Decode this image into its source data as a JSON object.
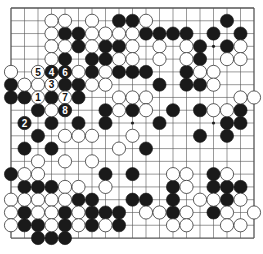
{
  "board": {
    "size": 19,
    "origin_x": 11,
    "origin_y": 8,
    "spacing_x": 13.5,
    "spacing_y": 12.78,
    "stone_radius": 6.6,
    "line_color": "#555555",
    "black_color": "#1a1a1a",
    "white_color": "#ffffff",
    "star_points": [
      [
        3,
        3
      ],
      [
        3,
        9
      ],
      [
        3,
        15
      ],
      [
        9,
        3
      ],
      [
        9,
        9
      ],
      [
        9,
        15
      ],
      [
        15,
        3
      ],
      [
        15,
        9
      ],
      [
        15,
        15
      ]
    ]
  },
  "stones": {
    "black": [
      [
        8,
        1
      ],
      [
        9,
        1
      ],
      [
        16,
        1
      ],
      [
        4,
        2
      ],
      [
        5,
        2
      ],
      [
        10,
        2
      ],
      [
        11,
        2
      ],
      [
        12,
        2
      ],
      [
        13,
        2
      ],
      [
        15,
        2
      ],
      [
        17,
        2
      ],
      [
        5,
        3
      ],
      [
        7,
        3
      ],
      [
        8,
        3
      ],
      [
        14,
        3
      ],
      [
        16,
        3
      ],
      [
        4,
        4
      ],
      [
        6,
        4
      ],
      [
        7,
        4
      ],
      [
        14,
        4
      ],
      [
        6,
        5
      ],
      [
        8,
        5
      ],
      [
        9,
        5
      ],
      [
        10,
        5
      ],
      [
        13,
        5
      ],
      [
        0,
        6
      ],
      [
        4,
        6
      ],
      [
        5,
        6
      ],
      [
        11,
        6
      ],
      [
        13,
        6
      ],
      [
        14,
        6
      ],
      [
        0,
        7
      ],
      [
        1,
        7
      ],
      [
        3,
        7
      ],
      [
        5,
        7
      ],
      [
        2,
        8
      ],
      [
        7,
        8
      ],
      [
        9,
        8
      ],
      [
        12,
        8
      ],
      [
        14,
        8
      ],
      [
        17,
        8
      ],
      [
        3,
        9
      ],
      [
        5,
        9
      ],
      [
        7,
        9
      ],
      [
        11,
        9
      ],
      [
        16,
        9
      ],
      [
        17,
        9
      ],
      [
        2,
        10
      ],
      [
        14,
        10
      ],
      [
        16,
        10
      ],
      [
        1,
        11
      ],
      [
        3,
        11
      ],
      [
        10,
        11
      ],
      [
        0,
        13
      ],
      [
        7,
        13
      ],
      [
        9,
        13
      ],
      [
        15,
        13
      ],
      [
        1,
        14
      ],
      [
        2,
        14
      ],
      [
        3,
        14
      ],
      [
        12,
        14
      ],
      [
        15,
        14
      ],
      [
        16,
        14
      ],
      [
        17,
        14
      ],
      [
        5,
        15
      ],
      [
        6,
        15
      ],
      [
        9,
        15
      ],
      [
        10,
        15
      ],
      [
        12,
        15
      ],
      [
        16,
        15
      ],
      [
        1,
        16
      ],
      [
        4,
        16
      ],
      [
        6,
        16
      ],
      [
        7,
        16
      ],
      [
        8,
        16
      ],
      [
        12,
        16
      ],
      [
        15,
        16
      ],
      [
        1,
        17
      ],
      [
        2,
        17
      ],
      [
        4,
        17
      ],
      [
        6,
        17
      ],
      [
        8,
        17
      ],
      [
        2,
        18
      ],
      [
        3,
        18
      ],
      [
        4,
        18
      ]
    ],
    "white": [
      [
        3,
        1
      ],
      [
        4,
        1
      ],
      [
        6,
        1
      ],
      [
        10,
        1
      ],
      [
        3,
        2
      ],
      [
        6,
        2
      ],
      [
        7,
        2
      ],
      [
        8,
        2
      ],
      [
        9,
        2
      ],
      [
        3,
        3
      ],
      [
        4,
        3
      ],
      [
        6,
        3
      ],
      [
        9,
        3
      ],
      [
        11,
        3
      ],
      [
        13,
        3
      ],
      [
        17,
        3
      ],
      [
        3,
        4
      ],
      [
        8,
        4
      ],
      [
        9,
        4
      ],
      [
        11,
        4
      ],
      [
        13,
        4
      ],
      [
        16,
        4
      ],
      [
        17,
        4
      ],
      [
        0,
        5
      ],
      [
        5,
        5
      ],
      [
        7,
        5
      ],
      [
        14,
        5
      ],
      [
        15,
        5
      ],
      [
        1,
        6
      ],
      [
        2,
        6
      ],
      [
        6,
        6
      ],
      [
        7,
        6
      ],
      [
        15,
        6
      ],
      [
        8,
        7
      ],
      [
        9,
        7
      ],
      [
        10,
        7
      ],
      [
        17,
        7
      ],
      [
        18,
        7
      ],
      [
        3,
        8
      ],
      [
        8,
        8
      ],
      [
        10,
        8
      ],
      [
        15,
        8
      ],
      [
        16,
        8
      ],
      [
        4,
        10
      ],
      [
        5,
        10
      ],
      [
        6,
        10
      ],
      [
        9,
        10
      ],
      [
        8,
        11
      ],
      [
        2,
        12
      ],
      [
        4,
        12
      ],
      [
        6,
        12
      ],
      [
        1,
        13
      ],
      [
        2,
        13
      ],
      [
        12,
        13
      ],
      [
        13,
        13
      ],
      [
        16,
        13
      ],
      [
        4,
        14
      ],
      [
        5,
        14
      ],
      [
        7,
        14
      ],
      [
        13,
        14
      ],
      [
        0,
        15
      ],
      [
        1,
        15
      ],
      [
        2,
        15
      ],
      [
        3,
        15
      ],
      [
        4,
        15
      ],
      [
        14,
        15
      ],
      [
        15,
        15
      ],
      [
        17,
        15
      ],
      [
        0,
        16
      ],
      [
        2,
        16
      ],
      [
        3,
        16
      ],
      [
        5,
        16
      ],
      [
        10,
        16
      ],
      [
        11,
        16
      ],
      [
        13,
        16
      ],
      [
        16,
        16
      ],
      [
        18,
        16
      ],
      [
        0,
        17
      ],
      [
        3,
        17
      ],
      [
        5,
        17
      ],
      [
        7,
        17
      ],
      [
        12,
        17
      ],
      [
        13,
        17
      ],
      [
        16,
        17
      ],
      [
        17,
        17
      ]
    ]
  },
  "moves": [
    {
      "number": "1",
      "color": "white",
      "x": 2,
      "y": 7
    },
    {
      "number": "2",
      "color": "black",
      "x": 1,
      "y": 9
    },
    {
      "number": "3",
      "color": "white",
      "x": 3,
      "y": 6
    },
    {
      "number": "4",
      "color": "black",
      "x": 3,
      "y": 5
    },
    {
      "number": "5",
      "color": "white",
      "x": 2,
      "y": 5
    },
    {
      "number": "6",
      "color": "black",
      "x": 4,
      "y": 5
    },
    {
      "number": "7",
      "color": "white",
      "x": 4,
      "y": 7
    },
    {
      "number": "8",
      "color": "black",
      "x": 4,
      "y": 8
    }
  ]
}
